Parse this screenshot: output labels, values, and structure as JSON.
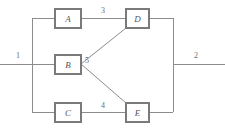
{
  "diagram": {
    "type": "block-network-diagram",
    "title": "",
    "background_color": "#ffffff",
    "line_color": "#8c8c8c",
    "box_border_color": "#7a7a7a",
    "text_color": "#555555",
    "nodes": [
      {
        "id": "A",
        "label": "A",
        "x": 55,
        "y": 9,
        "w": 26,
        "h": 19
      },
      {
        "id": "B",
        "label": "B",
        "x": 55,
        "y": 55,
        "w": 26,
        "h": 19
      },
      {
        "id": "C",
        "label": "C",
        "x": 55,
        "y": 103,
        "w": 26,
        "h": 19
      },
      {
        "id": "D",
        "label": "D",
        "x": 126,
        "y": 9,
        "w": 23,
        "h": 19
      },
      {
        "id": "E",
        "label": "E",
        "x": 126,
        "y": 103,
        "w": 23,
        "h": 19
      }
    ],
    "edge_labels": [
      {
        "id": "label-1",
        "text": "1",
        "x": 18,
        "y": 56
      },
      {
        "id": "label-2",
        "text": "2",
        "x": 196,
        "y": 56
      },
      {
        "id": "label-3",
        "text": "3",
        "x": 103,
        "y": 11
      },
      {
        "id": "label-4",
        "text": "4",
        "x": 103,
        "y": 106
      },
      {
        "id": "label-5",
        "text": "5",
        "x": 87,
        "y": 61
      }
    ],
    "buses": {
      "left_bus_x": 32,
      "right_bus_x": 173,
      "bus_top_y": 18,
      "bus_bottom_y": 112,
      "mid_y": 64
    }
  }
}
